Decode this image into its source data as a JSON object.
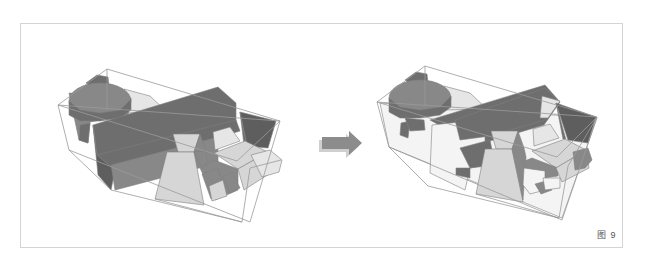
{
  "figure": {
    "caption": "图 9",
    "colors": {
      "dark": "#6e6e6e",
      "darker": "#5e5e5e",
      "mid": "#888888",
      "light": "#d6d6d6",
      "lighter": "#e6e6e6",
      "white": "#f4f4f4",
      "edge": "#7f7f7f",
      "bbox": "#9a9a9a",
      "arrow": "#8c8c8c"
    }
  },
  "left_model": {
    "name": "massing-model-original",
    "bbox": [
      [
        [
          58,
          105
        ],
        [
          107,
          69
        ],
        [
          280,
          121
        ],
        [
          237,
          161
        ],
        [
          58,
          105
        ]
      ],
      [
        [
          58,
          105
        ],
        [
          69,
          150
        ],
        [
          250,
          222
        ],
        [
          280,
          121
        ]
      ],
      [
        [
          69,
          150
        ],
        [
          111,
          190
        ],
        [
          242,
          222
        ]
      ],
      [
        [
          107,
          69
        ],
        [
          107,
          110
        ]
      ]
    ],
    "shapes": [
      {
        "fill": "dark",
        "points": "86,83 97,75 108,77 109,86 95,90"
      },
      {
        "fill": "lighter",
        "points": "124,89 150,96 167,112 125,113"
      },
      {
        "fill": "mid",
        "points": "69,93 79,140 88,143 90,122 128,115 131,98"
      },
      {
        "fill": "dark",
        "points": "79,140 88,143 90,123 80,125"
      },
      {
        "type": "ellipse",
        "fill": "mid",
        "cx": 100,
        "cy": 101,
        "rx": 31,
        "ry": 18
      },
      {
        "fill": "dark",
        "points": "69,101 69,115 80,121 100,121 120,118 131,110 131,99 120,110 100,113 80,110"
      },
      {
        "fill": "dark",
        "points": "93,125 218,87 236,103 236,130 115,170 97,155"
      },
      {
        "fill": "darker",
        "points": "93,125 97,155 115,170 111,190 98,175"
      },
      {
        "fill": "dark",
        "points": "97,155 236,120 240,131 115,170"
      },
      {
        "fill": "mid",
        "points": "111,165 218,137 218,163 115,190"
      },
      {
        "fill": "darker",
        "points": "240,112 276,121 268,148 247,146"
      },
      {
        "fill": "dark",
        "points": "240,112 247,146 244,145"
      },
      {
        "fill": "lighter",
        "points": "213,132 230,127 240,141 215,150"
      },
      {
        "fill": "light",
        "points": "173,134 200,134 194,152 178,152"
      },
      {
        "fill": "mid",
        "points": "200,134 206,151 194,152"
      },
      {
        "fill": "light",
        "points": "167,152 194,152 204,205 155,199"
      },
      {
        "fill": "mid",
        "points": "194,152 206,151 207,160 204,172"
      },
      {
        "fill": "light",
        "points": "214,153 245,141 268,152 238,169"
      },
      {
        "fill": "mid",
        "points": "200,168 214,160 238,169 238,190 215,200"
      },
      {
        "fill": "light",
        "points": "238,169 268,152 272,172 244,190"
      },
      {
        "fill": "lighter",
        "points": "251,155 270,150 282,160 279,172 262,177"
      },
      {
        "fill": "mid",
        "points": "202,174 218,168 226,193 211,199"
      },
      {
        "fill": "light",
        "points": "209,186 223,180 227,196 212,201"
      },
      {
        "fill": "mid",
        "points": "223,177 232,172 240,188 230,193"
      }
    ],
    "overlay_lines": [
      [
        [
          58,
          105
        ],
        [
          280,
          121
        ]
      ],
      [
        [
          155,
          199
        ],
        [
          242,
          222
        ],
        [
          250,
          168
        ],
        [
          281,
          160
        ]
      ]
    ]
  },
  "arrow": {
    "name": "transform-arrow",
    "points": "322,137 349,137 349,131 362,143 349,155 349,149 322,149"
  },
  "right_model": {
    "name": "massing-model-subtracted",
    "bbox": [
      [
        [
          377,
          102
        ],
        [
          425,
          66
        ],
        [
          597,
          117
        ],
        [
          557,
          157
        ],
        [
          377,
          102
        ]
      ],
      [
        [
          377,
          102
        ],
        [
          389,
          147
        ],
        [
          562,
          220
        ],
        [
          597,
          117
        ]
      ],
      [
        [
          389,
          147
        ],
        [
          428,
          186
        ],
        [
          559,
          218
        ]
      ],
      [
        [
          425,
          66
        ],
        [
          425,
          106
        ]
      ]
    ],
    "shapes": [
      {
        "fill": "white",
        "points": "380,103 597,118 562,218 389,147"
      },
      {
        "fill": "dark",
        "points": "405,80 416,72 427,74 428,83 414,87"
      },
      {
        "fill": "lighter",
        "points": "444,86 470,93 487,109 444,110"
      },
      {
        "fill": "dark",
        "points": "400,135 408,138 410,121 401,123"
      },
      {
        "type": "ellipse",
        "fill": "mid",
        "cx": 420,
        "cy": 98,
        "rx": 31,
        "ry": 18
      },
      {
        "fill": "dark",
        "points": "389,98 389,112 400,118 420,118 440,115 451,107 451,96 440,107 420,110 400,107"
      },
      {
        "fill": "dark",
        "points": "405,118 424,120 425,130 410,131"
      },
      {
        "fill": "dark",
        "points": "430,120 545,85 560,102 544,125 460,150 470,142"
      },
      {
        "fill": "white",
        "points": "432,125 460,122 460,138 485,136 485,165 470,168 465,190 430,173"
      },
      {
        "fill": "dark",
        "points": "455,120 545,88 557,100 545,120 490,136 460,140"
      },
      {
        "fill": "dark",
        "points": "460,148 490,140 495,165 470,168"
      },
      {
        "fill": "dark",
        "points": "456,168 470,168 470,178 456,175"
      },
      {
        "fill": "lighter",
        "points": "542,96 560,101 548,118 540,118"
      },
      {
        "fill": "darker",
        "points": "556,103 596,117 588,143 568,140"
      },
      {
        "fill": "dark",
        "points": "556,103 566,140 563,139"
      },
      {
        "fill": "lighter",
        "points": "533,129 550,124 559,138 534,146"
      },
      {
        "fill": "light",
        "points": "491,131 518,131 512,149 496,149"
      },
      {
        "fill": "mid",
        "points": "518,131 524,148 512,149"
      },
      {
        "fill": "light",
        "points": "485,149 512,149 523,202 476,194"
      },
      {
        "fill": "mid",
        "points": "512,149 524,148 526,157 523,200"
      },
      {
        "fill": "light",
        "points": "532,151 565,139 586,150 556,168"
      },
      {
        "fill": "mid",
        "points": "522,162 532,158 558,168 558,176 530,180"
      },
      {
        "fill": "light",
        "points": "556,168 586,150 589,168 562,182"
      },
      {
        "fill": "white",
        "points": "524,168 545,171 545,190 530,194 523,185"
      },
      {
        "fill": "mid",
        "points": "535,184 546,181 552,190 541,194"
      },
      {
        "fill": "white",
        "points": "543,178 560,178 560,188 545,190"
      },
      {
        "fill": "mid",
        "points": "573,152 588,148 592,160 585,168 575,170"
      }
    ],
    "overlay_lines": [
      [
        [
          377,
          102
        ],
        [
          597,
          117
        ]
      ],
      [
        [
          476,
          194
        ],
        [
          559,
          218
        ],
        [
          568,
          166
        ],
        [
          597,
          117
        ]
      ]
    ]
  }
}
